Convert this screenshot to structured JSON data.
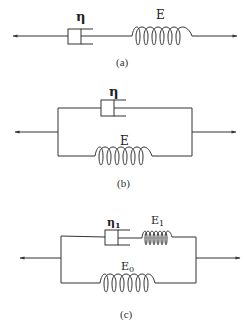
{
  "diagrams": [
    {
      "id": "a",
      "caption": "(a)",
      "topology": "series",
      "elements": [
        {
          "type": "dashpot",
          "label": "η"
        },
        {
          "type": "spring",
          "label": "E"
        }
      ]
    },
    {
      "id": "b",
      "caption": "(b)",
      "topology": "parallel",
      "elements": [
        {
          "type": "dashpot",
          "label": "η",
          "branch": "top"
        },
        {
          "type": "spring",
          "label": "E",
          "branch": "bottom"
        }
      ]
    },
    {
      "id": "c",
      "caption": "(c)",
      "topology": "standard-linear-solid",
      "elements": [
        {
          "type": "dashpot",
          "label": "η",
          "subscript": "1",
          "branch": "top"
        },
        {
          "type": "spring",
          "label": "E",
          "subscript": "1",
          "branch": "top"
        },
        {
          "type": "spring",
          "label": "E",
          "subscript": "0",
          "branch": "bottom"
        }
      ]
    }
  ],
  "colors": {
    "stroke": "#333333",
    "background": "#ffffff"
  }
}
